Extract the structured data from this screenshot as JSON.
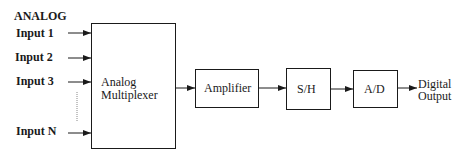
{
  "diagram": {
    "title": "ANALOG",
    "inputs": [
      "Input 1",
      "Input 2",
      "Input 3",
      "Input N"
    ],
    "blocks": {
      "multiplexer": [
        "Analog",
        "Multiplexer"
      ],
      "amplifier": "Amplifier",
      "sample_hold": "S/H",
      "adc": "A/D"
    },
    "output": [
      "Digital",
      "Output"
    ]
  }
}
